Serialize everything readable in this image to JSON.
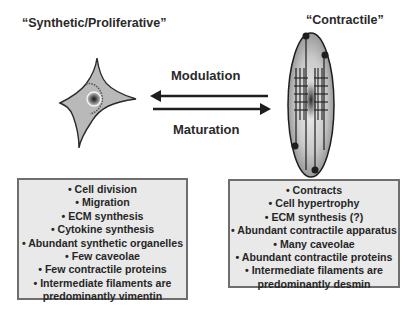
{
  "left_cell": {
    "title": "“Synthetic/Proliferative”",
    "properties": [
      "• Cell division",
      "• Migration",
      "• ECM synthesis",
      "• Cytokine synthesis",
      "• Abundant synthetic organelles",
      "• Few caveolae",
      "• Few contractile proteins",
      "• Intermediate filaments are",
      "predominantly vimentin"
    ],
    "icon": "stellate-cell-icon"
  },
  "right_cell": {
    "title": "“Contractile”",
    "properties": [
      "• Contracts",
      "• Cell hypertrophy",
      "• ECM synthesis (?)",
      "• Abundant contractile apparatus",
      "• Many caveolae",
      "• Abundant contractile proteins",
      "• Intermediate filaments are",
      "predominantly desmin"
    ],
    "icon": "spindle-cell-icon"
  },
  "transitions": {
    "to_synthetic": "Modulation",
    "to_contractile": "Maturation"
  },
  "colors": {
    "box_fill": "#e9e9e9",
    "box_border": "#6e6e6e",
    "cell_fill": "#b8b8b8",
    "text": "#2a2a2a"
  }
}
